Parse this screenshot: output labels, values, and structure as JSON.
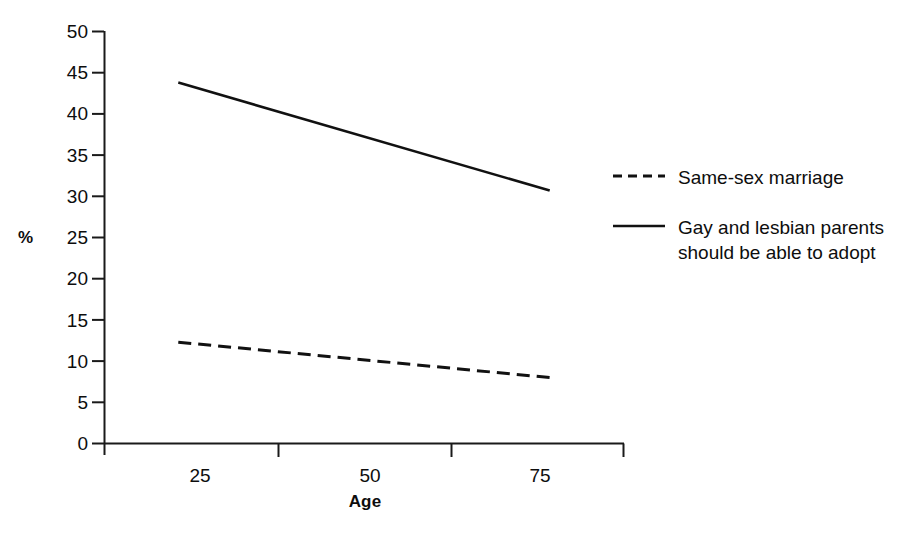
{
  "chart_data": {
    "type": "line",
    "title": "",
    "subtitle": "",
    "xlabel": "Age",
    "ylabel": "%",
    "x": [
      25,
      75
    ],
    "xlim": [
      15,
      85
    ],
    "ylim": [
      0,
      50
    ],
    "xticks": [
      25,
      50,
      75
    ],
    "xtick_labels": [
      "25",
      "50",
      "75"
    ],
    "yticks": [
      0,
      5,
      10,
      15,
      20,
      25,
      30,
      35,
      40,
      45,
      50
    ],
    "ytick_labels": [
      "0",
      "5",
      "10",
      "15",
      "20",
      "25",
      "30",
      "35",
      "40",
      "45",
      "50"
    ],
    "grid": false,
    "legend_position": "right",
    "series": [
      {
        "name": "Same-sex marriage",
        "style": "dashed",
        "color": "#111111",
        "values": [
          12.3,
          8.0
        ]
      },
      {
        "name": "Gay and lesbian parents should be able to adopt",
        "style": "solid",
        "color": "#111111",
        "values": [
          43.8,
          30.7
        ]
      }
    ]
  },
  "axes": {
    "y_title": "%",
    "x_title": "Age",
    "y_tick_labels": [
      "50",
      "45",
      "40",
      "35",
      "30",
      "25",
      "20",
      "15",
      "10",
      "5",
      "0"
    ],
    "x_tick_labels": [
      "25",
      "50",
      "75"
    ]
  },
  "legend": {
    "entries": [
      {
        "label": "Same-sex marriage",
        "swatch": "dashed-line-swatch"
      },
      {
        "label": "Gay and lesbian parents should be able to adopt",
        "swatch": "solid-line-swatch"
      }
    ]
  }
}
